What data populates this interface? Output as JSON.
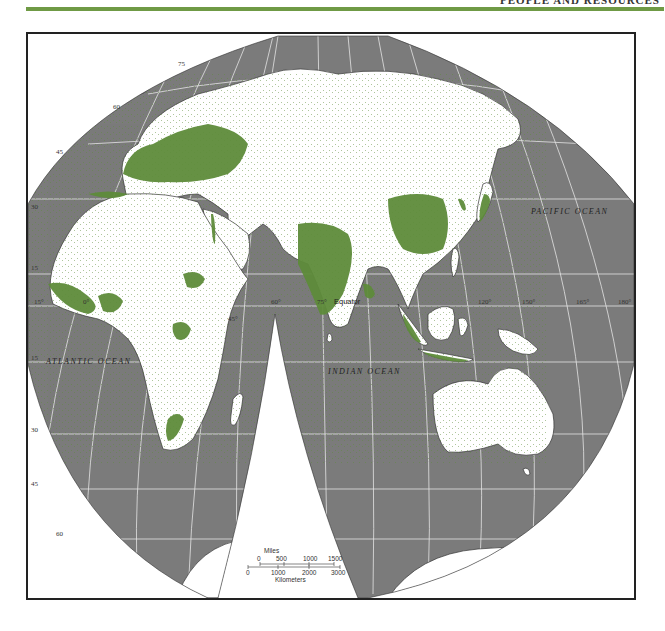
{
  "header": {
    "title": "PEOPLE AND RESOURCES",
    "rule_color": "#6f9a45"
  },
  "map": {
    "projection": "interrupted-homolosine-eastern-hemisphere",
    "colors": {
      "ocean": "#7b7b7b",
      "land": "#ffffff",
      "dense_population": "#5e8c3a",
      "graticule": "#e4e4e4",
      "border": "#222222"
    },
    "ocean_labels": {
      "atlantic": "ATLANTIC OCEAN",
      "indian": "INDIAN OCEAN",
      "pacific": "PACIFIC OCEAN"
    },
    "equator_label": "Equator",
    "latitude_labels": [
      "75",
      "60",
      "45",
      "30",
      "15",
      "0",
      "15",
      "30",
      "45",
      "60"
    ],
    "longitude_labels": [
      "15°",
      "0°",
      "45°",
      "60°",
      "75°",
      "120°",
      "150°",
      "165°",
      "180°"
    ],
    "regions_dense": [
      "Europe",
      "India",
      "Eastern China",
      "Japan",
      "Java",
      "Nile Valley",
      "West Africa coast",
      "Nigeria",
      "Ethiopian Highlands",
      "Great Lakes Africa",
      "South Africa east coast",
      "Korea",
      "Bangladesh"
    ],
    "scale_bar": {
      "miles_label": "Miles",
      "miles_ticks": [
        "0",
        "500",
        "1000",
        "1500"
      ],
      "km_label": "Kilometers",
      "km_ticks": [
        "0",
        "1000",
        "2000",
        "3000"
      ]
    }
  }
}
